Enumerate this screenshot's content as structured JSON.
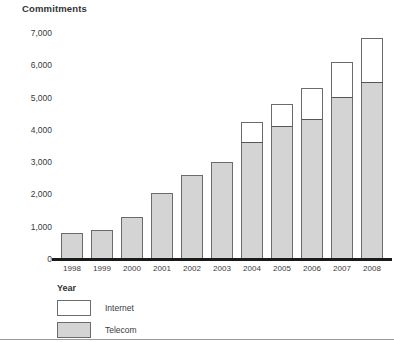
{
  "chart_data": {
    "type": "bar",
    "stacked": true,
    "title": "Commitments",
    "xlabel": "Year",
    "ylabel": "Commitments",
    "categories": [
      "1998",
      "1999",
      "2000",
      "2001",
      "2002",
      "2003",
      "2004",
      "2005",
      "2006",
      "2007",
      "2008"
    ],
    "series": [
      {
        "name": "Telecom",
        "color": "#d4d4d4",
        "values": [
          800,
          900,
          1300,
          2050,
          2600,
          3000,
          3600,
          4100,
          4300,
          5000,
          5450
        ]
      },
      {
        "name": "Internet",
        "color": "#ffffff",
        "values": [
          0,
          0,
          0,
          0,
          0,
          0,
          650,
          700,
          1000,
          1100,
          1400
        ]
      }
    ],
    "totals": [
      800,
      900,
      1300,
      2050,
      2600,
      3000,
      4250,
      4800,
      5300,
      6100,
      6850
    ],
    "ylim": [
      0,
      7000
    ],
    "yticks": [
      "0",
      "1,000",
      "2,000",
      "3,000",
      "4,000",
      "5,000",
      "6,000",
      "7,000"
    ],
    "ytick_values": [
      0,
      1000,
      2000,
      3000,
      4000,
      5000,
      6000,
      7000
    ],
    "grid": false,
    "legend_position": "bottom-left",
    "legend": [
      "Internet",
      "Telecom"
    ]
  }
}
